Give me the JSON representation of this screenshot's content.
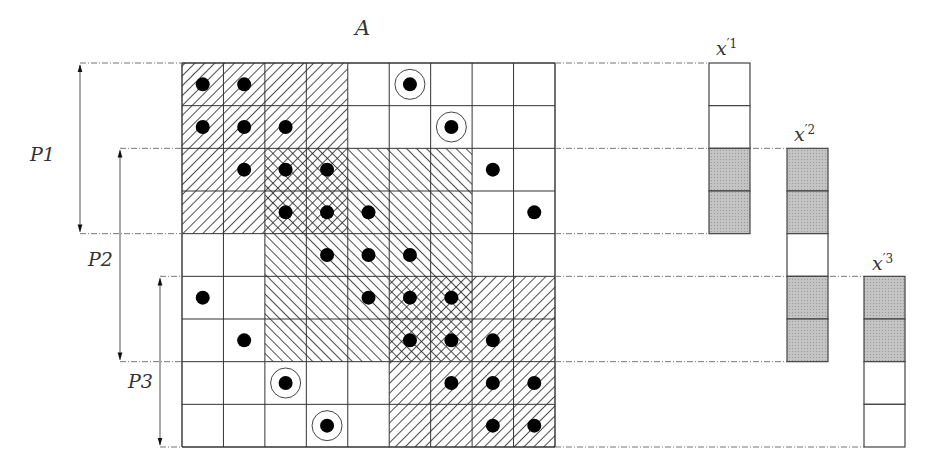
{
  "matrix": {
    "label": "A",
    "rows": 9,
    "cols": 9,
    "hatch_regions": [
      {
        "name": "partition-1-block",
        "pattern": "forward",
        "row_start": 0,
        "row_end": 3,
        "col_start": 0,
        "col_end": 3
      },
      {
        "name": "partition-2-block",
        "pattern": "backward",
        "row_start": 2,
        "row_end": 6,
        "col_start": 2,
        "col_end": 6
      },
      {
        "name": "partition-3-block",
        "pattern": "forward",
        "row_start": 5,
        "row_end": 8,
        "col_start": 5,
        "col_end": 8
      }
    ],
    "dots": [
      [
        0,
        0
      ],
      [
        0,
        1
      ],
      [
        1,
        0
      ],
      [
        1,
        1
      ],
      [
        1,
        2
      ],
      [
        2,
        1
      ],
      [
        2,
        2
      ],
      [
        2,
        3
      ],
      [
        2,
        7
      ],
      [
        3,
        2
      ],
      [
        3,
        3
      ],
      [
        3,
        4
      ],
      [
        3,
        8
      ],
      [
        4,
        3
      ],
      [
        4,
        4
      ],
      [
        4,
        5
      ],
      [
        5,
        0
      ],
      [
        5,
        4
      ],
      [
        5,
        5
      ],
      [
        5,
        6
      ],
      [
        6,
        1
      ],
      [
        6,
        5
      ],
      [
        6,
        6
      ],
      [
        6,
        7
      ],
      [
        7,
        6
      ],
      [
        7,
        7
      ],
      [
        7,
        8
      ],
      [
        8,
        7
      ],
      [
        8,
        8
      ]
    ],
    "circled_dots": [
      [
        0,
        5
      ],
      [
        1,
        6
      ],
      [
        7,
        2
      ],
      [
        8,
        3
      ]
    ]
  },
  "partitions": [
    {
      "label": "P1",
      "row_start": 0,
      "row_end": 4
    },
    {
      "label": "P2",
      "row_start": 2,
      "row_end": 7
    },
    {
      "label": "P3",
      "row_start": 5,
      "row_end": 9
    }
  ],
  "vectors": [
    {
      "label": "x",
      "prime": "′",
      "index": "1",
      "row_start": 0,
      "cells": [
        false,
        false,
        true,
        true
      ]
    },
    {
      "label": "x",
      "prime": "′",
      "index": "2",
      "row_start": 2,
      "cells": [
        true,
        true,
        false,
        true,
        true
      ]
    },
    {
      "label": "x",
      "prime": "′",
      "index": "3",
      "row_start": 5,
      "cells": [
        true,
        true,
        false,
        false
      ]
    }
  ],
  "colors": {
    "grid_line": "#333333",
    "hatch": "#222222",
    "dot": "#000000",
    "shaded_cell": "#bdbdbd",
    "guide_line": "#777777"
  }
}
